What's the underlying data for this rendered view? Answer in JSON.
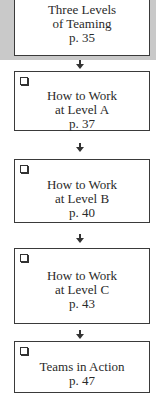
{
  "flow": [
    {
      "lines": [
        "Three Levels",
        "of Teaming",
        "p. 35"
      ],
      "checkbox": false,
      "highlighted": true
    },
    {
      "lines": [
        "How to Work",
        "at Level A",
        "p. 37"
      ],
      "checkbox": true
    },
    {
      "lines": [
        "How to Work",
        "at Level B",
        "p. 40"
      ],
      "checkbox": true
    },
    {
      "lines": [
        "How to Work",
        "at Level C",
        "p. 43"
      ],
      "checkbox": true
    },
    {
      "lines": [
        "Teams in Action",
        "p. 47"
      ],
      "checkbox": true
    }
  ],
  "colors": {
    "highlight_bg": "#c9c9c9",
    "border": "#3a3a3a"
  }
}
